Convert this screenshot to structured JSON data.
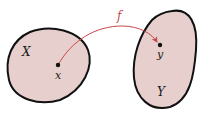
{
  "diagram": {
    "type": "function-mapping",
    "colors": {
      "set_fill": "#e6cfcc",
      "set_stroke": "#111111",
      "arrow": "#c8474a",
      "point": "#111111",
      "label": "#1a1a1a"
    },
    "domain": {
      "set_label": "X",
      "point_label": "x"
    },
    "codomain": {
      "set_label": "Y",
      "point_label": "y"
    },
    "mapping": {
      "label": "f",
      "from": "x",
      "to": "y"
    }
  }
}
